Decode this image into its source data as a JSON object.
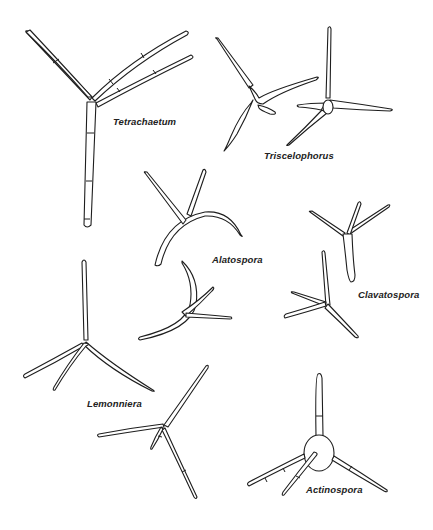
{
  "figure": {
    "background": "#ffffff",
    "line_color": "#1e1e1e",
    "specimens": [
      {
        "id": "tetrachaetum",
        "label": "Tetrachaetum",
        "label_pos": [
          113,
          123
        ]
      },
      {
        "id": "triscelophorus",
        "label": "Triscelophorus",
        "label_pos": [
          264,
          156
        ]
      },
      {
        "id": "alatospora",
        "label": "Alatospora",
        "label_pos": [
          212,
          255
        ]
      },
      {
        "id": "clavatospora",
        "label": "Clavatospora",
        "label_pos": [
          358,
          290
        ]
      },
      {
        "id": "lemonniera",
        "label": "Lemonniera",
        "label_pos": [
          87,
          401
        ]
      },
      {
        "id": "actinospora",
        "label": "Actinospora",
        "label_pos": [
          306,
          486
        ]
      }
    ]
  }
}
